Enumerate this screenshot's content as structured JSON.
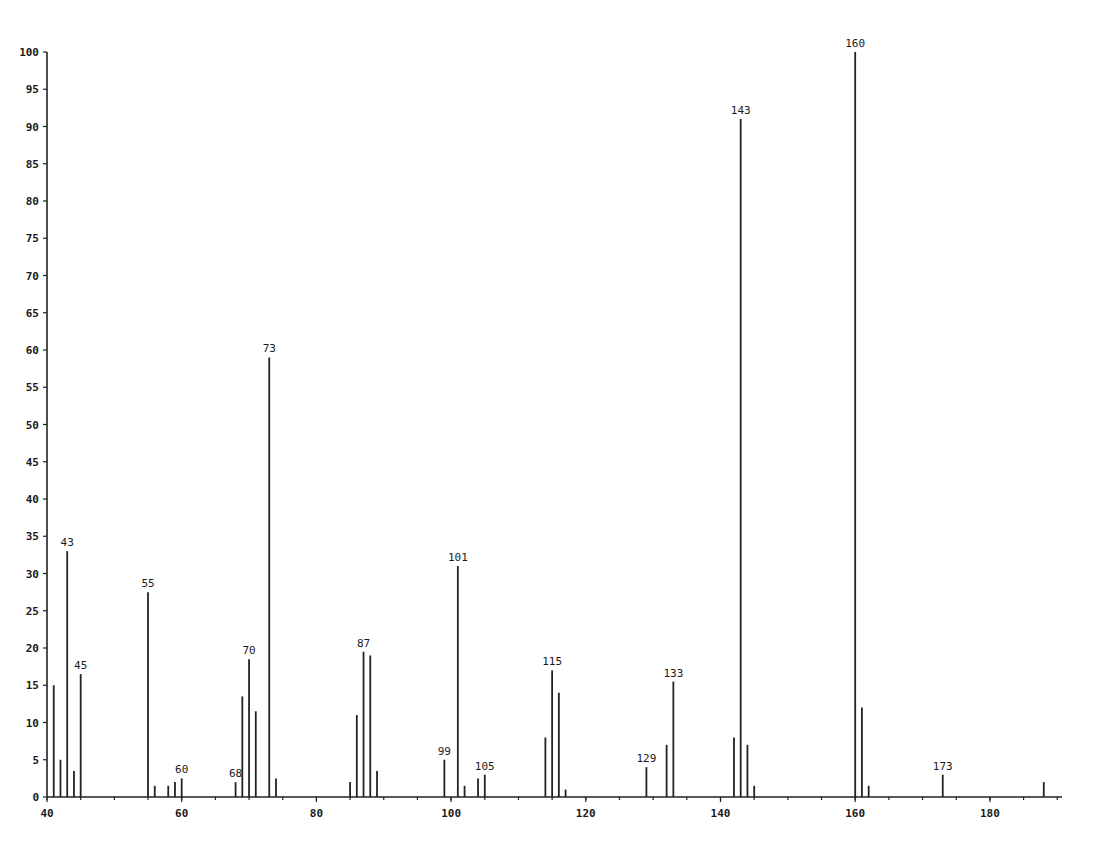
{
  "chart_data": {
    "type": "bar",
    "title": "",
    "xlabel": "",
    "ylabel": "",
    "xlim": [
      40,
      190
    ],
    "ylim": [
      0,
      100
    ],
    "grid": false,
    "legend": null,
    "x_ticks": [
      40,
      60,
      80,
      100,
      120,
      140,
      160,
      180
    ],
    "x_tick_labels": [
      "40",
      "60",
      "80",
      "100",
      "120",
      "140",
      "160",
      "180"
    ],
    "y_ticks": [
      0,
      5,
      10,
      15,
      20,
      25,
      30,
      35,
      40,
      45,
      50,
      55,
      60,
      65,
      70,
      75,
      80,
      85,
      90,
      95,
      100
    ],
    "y_tick_labels": [
      "0",
      "5",
      "10",
      "15",
      "20",
      "25",
      "30",
      "35",
      "40",
      "45",
      "50",
      "55",
      "60",
      "65",
      "70",
      "75",
      "80",
      "85",
      "90",
      "95",
      "100"
    ],
    "x": [
      41,
      42,
      43,
      44,
      45,
      55,
      56,
      58,
      59,
      60,
      68,
      69,
      70,
      71,
      73,
      74,
      85,
      86,
      87,
      88,
      89,
      99,
      101,
      102,
      104,
      105,
      114,
      115,
      116,
      117,
      129,
      132,
      133,
      142,
      143,
      144,
      145,
      160,
      161,
      162,
      173,
      188
    ],
    "values": [
      15,
      5,
      33,
      3.5,
      16.5,
      27.5,
      1.5,
      1.5,
      2,
      2.5,
      2,
      13.5,
      18.5,
      11.5,
      59,
      2.5,
      2,
      11,
      19.5,
      19,
      3.5,
      5,
      31,
      1.5,
      2.5,
      3,
      8,
      17,
      14,
      1,
      4,
      7,
      15.5,
      8,
      91,
      7,
      1.5,
      100,
      12,
      1.5,
      3,
      2
    ],
    "annotations": [
      {
        "x": 43,
        "label": "43"
      },
      {
        "x": 45,
        "label": "45"
      },
      {
        "x": 55,
        "label": "55"
      },
      {
        "x": 60,
        "label": "60"
      },
      {
        "x": 68,
        "label": "68"
      },
      {
        "x": 70,
        "label": "70"
      },
      {
        "x": 73,
        "label": "73"
      },
      {
        "x": 87,
        "label": "87"
      },
      {
        "x": 99,
        "label": "99"
      },
      {
        "x": 101,
        "label": "101"
      },
      {
        "x": 105,
        "label": "105"
      },
      {
        "x": 115,
        "label": "115"
      },
      {
        "x": 129,
        "label": "129"
      },
      {
        "x": 133,
        "label": "133"
      },
      {
        "x": 143,
        "label": "143"
      },
      {
        "x": 160,
        "label": "160"
      },
      {
        "x": 173,
        "label": "173"
      }
    ]
  },
  "colors": {
    "ink": "#222222",
    "background": "#ffffff"
  }
}
